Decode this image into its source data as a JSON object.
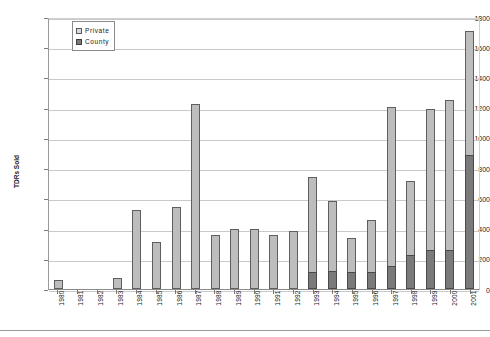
{
  "chart_data": {
    "type": "bar",
    "subtype": "stacked-bar",
    "title": "",
    "xlabel": "",
    "ylabel": "TDRs Sold",
    "ylim": [
      0,
      1800
    ],
    "ytick_step": 200,
    "yticks": [
      1800,
      1600,
      1400,
      1200,
      1000,
      800,
      600,
      400,
      200,
      0
    ],
    "grid": true,
    "legend_position": "top-left-inside",
    "categories": [
      "1980",
      "1981",
      "1982",
      "1983",
      "1984",
      "1985",
      "1986",
      "1987",
      "1988",
      "1989",
      "1990",
      "1991",
      "1992",
      "1993",
      "1994",
      "1995",
      "1996",
      "1997",
      "1998",
      "1999",
      "2000",
      "2001"
    ],
    "series": [
      {
        "name": "County",
        "color": "#7a7a7a",
        "values": [
          0,
          0,
          0,
          0,
          0,
          0,
          0,
          0,
          0,
          0,
          0,
          0,
          0,
          115,
          120,
          110,
          115,
          150,
          225,
          260,
          260,
          890
        ]
      },
      {
        "name": "Private",
        "color": "#bdbdbd",
        "values": [
          60,
          0,
          0,
          75,
          525,
          310,
          540,
          1225,
          355,
          395,
          400,
          355,
          385,
          625,
          460,
          225,
          345,
          1055,
          490,
          930,
          990,
          820
        ]
      }
    ],
    "totals": [
      60,
      0,
      0,
      75,
      525,
      310,
      540,
      1225,
      355,
      395,
      400,
      355,
      385,
      740,
      580,
      335,
      460,
      1205,
      715,
      1190,
      1250,
      1710
    ]
  },
  "legend": {
    "items": [
      {
        "label": "Private",
        "swatch": "private-swatch"
      },
      {
        "label": "County",
        "swatch": "county-swatch"
      }
    ]
  },
  "colors": {
    "private": "#bdbdbd",
    "county": "#7a7a7a",
    "grid": "#c9c9c9",
    "axis": "#8a8a8a"
  }
}
